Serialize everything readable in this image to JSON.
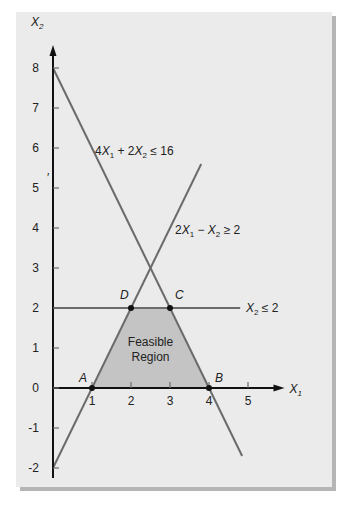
{
  "chart_data": {
    "type": "line",
    "title": "",
    "xlabel": "X1",
    "ylabel": "X2",
    "xlim": [
      0,
      5.5
    ],
    "ylim": [
      -2,
      8.5
    ],
    "x_ticks": [
      1,
      2,
      3,
      4,
      5
    ],
    "y_ticks": [
      -2,
      -1,
      0,
      1,
      2,
      3,
      4,
      5,
      6,
      7,
      8
    ],
    "grid": false,
    "constraints": [
      {
        "name": "4X1 + 2X2 <= 16",
        "label": "4X₁ + 2X₂ ≤ 16",
        "segment": [
          [
            0,
            8
          ],
          [
            4.85,
            -1.7
          ]
        ]
      },
      {
        "name": "2X1 - X2 >= 2",
        "label": "2X₁ − X₂ ≥ 2",
        "segment": [
          [
            0,
            -2
          ],
          [
            3.8,
            5.6
          ]
        ]
      },
      {
        "name": "X2 <= 2",
        "label": "X₂ ≤ 2",
        "segment": [
          [
            0,
            2
          ],
          [
            4.8,
            2
          ]
        ]
      }
    ],
    "points": [
      {
        "label": "A",
        "x": 1,
        "y": 0
      },
      {
        "label": "B",
        "x": 4,
        "y": 0
      },
      {
        "label": "C",
        "x": 3,
        "y": 2
      },
      {
        "label": "D",
        "x": 2,
        "y": 2
      }
    ],
    "feasible_region": {
      "label": "Feasible Region",
      "vertices": [
        [
          1,
          0
        ],
        [
          4,
          0
        ],
        [
          3,
          2
        ],
        [
          2,
          2
        ]
      ]
    }
  },
  "labels": {
    "x_axis": "X",
    "x_axis_sub": "1",
    "y_axis": "X",
    "y_axis_sub": "2",
    "region_line1": "Feasible",
    "region_line2": "Region",
    "stray_mark": "′"
  },
  "colors": {
    "background": "#ebebeb",
    "line": "#6b6b6b",
    "axis": "#111111",
    "region_fill": "#c4c4c4"
  }
}
